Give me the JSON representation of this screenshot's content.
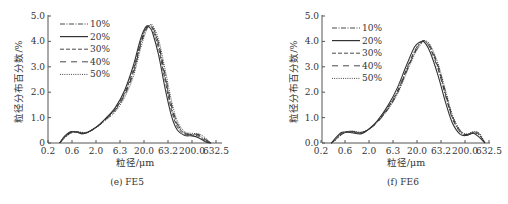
{
  "chart_data": [
    {
      "type": "line",
      "title": "",
      "caption": "(e) FE5",
      "xlabel": "粒径/μm",
      "ylabel": "粒径分布百分数/%",
      "x_scale": "log",
      "xticks": [
        "0.2",
        "0.6",
        "2.0",
        "6.3",
        "20.0",
        "63.2",
        "200.0",
        "632.5"
      ],
      "yticks": [
        "0",
        "1.0",
        "2.0",
        "3.0",
        "4.0",
        "5.0"
      ],
      "ylim": [
        0,
        5.0
      ],
      "grid": false,
      "legend_position": "upper left",
      "x": [
        0.35,
        0.45,
        0.6,
        0.8,
        1.0,
        1.3,
        2.0,
        3.0,
        5.0,
        8.0,
        12.0,
        17.0,
        22.0,
        26.0,
        30.0,
        40.0,
        55.0,
        75.0,
        100.0,
        140.0,
        200.0,
        280.0,
        380.0,
        500.0
      ],
      "series": [
        {
          "name": "10%",
          "style": "dashdot",
          "values": [
            0.0,
            0.25,
            0.42,
            0.44,
            0.4,
            0.42,
            0.62,
            0.9,
            1.3,
            1.95,
            2.8,
            3.9,
            4.5,
            4.62,
            4.55,
            3.9,
            2.6,
            1.4,
            0.7,
            0.38,
            0.33,
            0.3,
            0.12,
            0.0
          ]
        },
        {
          "name": "20%",
          "style": "solid",
          "values": [
            0.0,
            0.28,
            0.45,
            0.42,
            0.36,
            0.4,
            0.62,
            0.92,
            1.38,
            2.1,
            3.05,
            4.1,
            4.58,
            4.55,
            4.35,
            3.5,
            2.15,
            1.05,
            0.5,
            0.3,
            0.28,
            0.2,
            0.05,
            0.0
          ]
        },
        {
          "name": "30%",
          "style": "dashed",
          "values": [
            0.0,
            0.24,
            0.42,
            0.43,
            0.38,
            0.41,
            0.61,
            0.9,
            1.33,
            2.0,
            2.9,
            3.98,
            4.52,
            4.6,
            4.48,
            3.75,
            2.45,
            1.28,
            0.62,
            0.35,
            0.32,
            0.26,
            0.08,
            0.0
          ]
        },
        {
          "name": "40%",
          "style": "longdash",
          "values": [
            0.0,
            0.22,
            0.4,
            0.44,
            0.4,
            0.42,
            0.6,
            0.88,
            1.28,
            1.9,
            2.75,
            3.85,
            4.45,
            4.62,
            4.58,
            3.95,
            2.7,
            1.5,
            0.75,
            0.4,
            0.35,
            0.33,
            0.15,
            0.0
          ]
        },
        {
          "name": "50%",
          "style": "dotted",
          "values": [
            0.0,
            0.2,
            0.38,
            0.45,
            0.42,
            0.43,
            0.6,
            0.86,
            1.22,
            1.82,
            2.62,
            3.72,
            4.38,
            4.62,
            4.64,
            4.1,
            2.9,
            1.65,
            0.85,
            0.45,
            0.38,
            0.36,
            0.2,
            0.0
          ]
        }
      ]
    },
    {
      "type": "line",
      "title": "",
      "caption": "(f) FE6",
      "xlabel": "粒径/μm",
      "ylabel": "粒径分布百分数/%",
      "x_scale": "log",
      "xticks": [
        "0.2",
        "0.6",
        "2.0",
        "6.3",
        "20.0",
        "63.2",
        "200.0",
        "632.5"
      ],
      "yticks": [
        "0.0",
        "1.0",
        "2.0",
        "3.0",
        "4.0",
        "5.0"
      ],
      "ylim": [
        0,
        5.0
      ],
      "grid": false,
      "legend_position": "upper left",
      "x": [
        0.33,
        0.42,
        0.55,
        0.75,
        1.0,
        1.4,
        2.0,
        3.0,
        5.0,
        8.0,
        12.0,
        18.0,
        25.0,
        30.0,
        38.0,
        55.0,
        80.0,
        110.0,
        160.0,
        220.0,
        300.0,
        400.0,
        520.0
      ],
      "series": [
        {
          "name": "10%",
          "style": "dashdot",
          "values": [
            0.0,
            0.2,
            0.4,
            0.44,
            0.42,
            0.4,
            0.55,
            0.85,
            1.4,
            2.1,
            2.9,
            3.65,
            4.0,
            3.98,
            3.7,
            2.9,
            1.8,
            0.95,
            0.42,
            0.32,
            0.4,
            0.3,
            0.0
          ]
        },
        {
          "name": "20%",
          "style": "solid",
          "values": [
            0.0,
            0.24,
            0.42,
            0.42,
            0.38,
            0.37,
            0.55,
            0.88,
            1.48,
            2.22,
            3.05,
            3.8,
            4.0,
            3.92,
            3.55,
            2.65,
            1.55,
            0.78,
            0.34,
            0.3,
            0.38,
            0.22,
            0.0
          ]
        },
        {
          "name": "30%",
          "style": "dashed",
          "values": [
            0.0,
            0.18,
            0.38,
            0.44,
            0.43,
            0.41,
            0.54,
            0.84,
            1.38,
            2.05,
            2.85,
            3.6,
            3.98,
            4.0,
            3.75,
            2.98,
            1.88,
            1.0,
            0.45,
            0.33,
            0.42,
            0.32,
            0.0
          ]
        },
        {
          "name": "40%",
          "style": "longdash",
          "values": [
            0.0,
            0.15,
            0.35,
            0.45,
            0.45,
            0.42,
            0.54,
            0.82,
            1.34,
            2.0,
            2.8,
            3.55,
            3.96,
            4.02,
            3.8,
            3.05,
            1.95,
            1.05,
            0.48,
            0.34,
            0.44,
            0.36,
            0.0
          ]
        },
        {
          "name": "50%",
          "style": "dotted",
          "values": [
            0.0,
            0.14,
            0.34,
            0.46,
            0.46,
            0.43,
            0.55,
            0.82,
            1.32,
            1.96,
            2.75,
            3.5,
            3.92,
            4.02,
            3.85,
            3.12,
            2.02,
            1.1,
            0.5,
            0.35,
            0.45,
            0.38,
            0.0
          ]
        }
      ]
    }
  ],
  "panels": [
    {
      "caption": "(e) FE5",
      "xlabel": "粒径/μm",
      "ylabel": "粒径分布百分数/%"
    },
    {
      "caption": "(f) FE6",
      "xlabel": "粒径/μm",
      "ylabel": "粒径分布百分数/%"
    }
  ]
}
